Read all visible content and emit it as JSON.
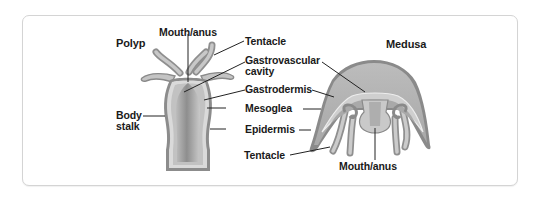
{
  "figure": {
    "polyp": {
      "title": "Polyp",
      "labels": {
        "mouth_anus": "Mouth/anus",
        "body_stalk_line1": "Body",
        "body_stalk_line2": "stalk"
      }
    },
    "medusa": {
      "title": "Medusa",
      "labels": {
        "mouth_anus": "Mouth/anus"
      }
    },
    "shared_labels": {
      "tentacle_top": "Tentacle",
      "gastrovascular_line1": "Gastrovascular",
      "gastrovascular_line2": "cavity",
      "gastrodermis": "Gastrodermis",
      "mesoglea": "Mesoglea",
      "epidermis": "Epidermis",
      "tentacle_bottom": "Tentacle"
    },
    "colors": {
      "epidermis": "#8a8a8a",
      "mesoglea": "#d9d9d9",
      "gastrodermis": "#bdbdbd",
      "cavity": "#a6a6a6",
      "leader_line": "#222222",
      "frame_border": "#d4d4d4"
    }
  }
}
